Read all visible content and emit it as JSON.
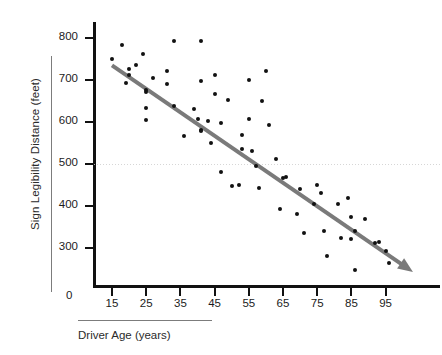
{
  "chart_data": {
    "type": "scatter",
    "title": "",
    "xlabel": "Driver Age (years)",
    "ylabel": "Sign Legibility Distance (feet)",
    "xlim": [
      10,
      105
    ],
    "ylim": [
      210,
      830
    ],
    "xticks": [
      15,
      25,
      35,
      45,
      55,
      65,
      75,
      85,
      95
    ],
    "yticks": [
      300,
      400,
      500,
      600,
      700,
      800
    ],
    "origin_label": "0",
    "grid": false,
    "legend": null,
    "point_color": "#111111",
    "trend_color": "#7a7a7a",
    "reference_line": {
      "orientation": "horizontal",
      "value": 500,
      "style": "dotted",
      "color": "#cfcfcf"
    },
    "trend_line": {
      "style": "solid-arrow",
      "x_start": 15,
      "y_start": 735,
      "x_end": 103,
      "y_end": 243
    },
    "points": [
      [
        15,
        750
      ],
      [
        18,
        783
      ],
      [
        19,
        693
      ],
      [
        20,
        727
      ],
      [
        20,
        712
      ],
      [
        22,
        735
      ],
      [
        24,
        763
      ],
      [
        25,
        677
      ],
      [
        25,
        672
      ],
      [
        25,
        633
      ],
      [
        25,
        605
      ],
      [
        27,
        705
      ],
      [
        31,
        722
      ],
      [
        31,
        691
      ],
      [
        33,
        793
      ],
      [
        33,
        637
      ],
      [
        36,
        567
      ],
      [
        39,
        632
      ],
      [
        40,
        607
      ],
      [
        41,
        698
      ],
      [
        41,
        793
      ],
      [
        41,
        582
      ],
      [
        41,
        578
      ],
      [
        43,
        603
      ],
      [
        44,
        550
      ],
      [
        45,
        667
      ],
      [
        45,
        712
      ],
      [
        47,
        597
      ],
      [
        47,
        481
      ],
      [
        49,
        652
      ],
      [
        50,
        447
      ],
      [
        52,
        450
      ],
      [
        53,
        570
      ],
      [
        53,
        536
      ],
      [
        55,
        700
      ],
      [
        55,
        607
      ],
      [
        56,
        532
      ],
      [
        57,
        496
      ],
      [
        58,
        443
      ],
      [
        59,
        650
      ],
      [
        60,
        722
      ],
      [
        61,
        593
      ],
      [
        63,
        513
      ],
      [
        64,
        393
      ],
      [
        65,
        467
      ],
      [
        66,
        468
      ],
      [
        69,
        380
      ],
      [
        70,
        441
      ],
      [
        71,
        335
      ],
      [
        74,
        404
      ],
      [
        75,
        449
      ],
      [
        76,
        430
      ],
      [
        77,
        341
      ],
      [
        78,
        281
      ],
      [
        81,
        405
      ],
      [
        82,
        324
      ],
      [
        84,
        418
      ],
      [
        85,
        373
      ],
      [
        85,
        322
      ],
      [
        86,
        341
      ],
      [
        86,
        247
      ],
      [
        89,
        369
      ],
      [
        92,
        312
      ],
      [
        93,
        315
      ],
      [
        95,
        293
      ],
      [
        96,
        264
      ]
    ]
  }
}
